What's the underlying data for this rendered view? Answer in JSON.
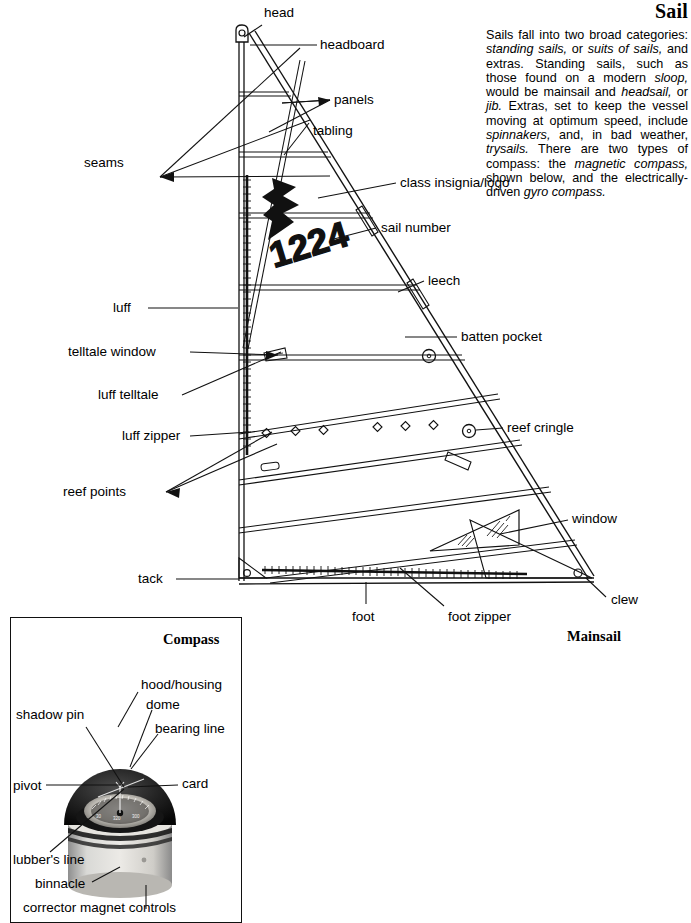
{
  "page": {
    "title": "Sail",
    "intro": "Sails fall into two broad categories: standing sails, or suits of sails, and extras. Standing sails, such as those found on a modern sloop, would be mainsail and headsail, or jib. Extras, set to keep the vessel moving at optimum speed, include spinnakers, and, in bad weather, trysails. There are two types of compass: the magnetic compass, shown below, and the electrically-driven gyro compass.",
    "mainsail_caption": "Mainsail"
  },
  "sail": {
    "sail_number": "1224",
    "labels": {
      "head": "head",
      "headboard": "headboard",
      "panels": "panels",
      "tabling": "tabling",
      "seams": "seams",
      "class_insignia": "class insignia/logo",
      "sail_number": "sail number",
      "leech": "leech",
      "luff": "luff",
      "batten_pocket": "batten pocket",
      "telltale_window": "telltale window",
      "luff_telltale": "luff telltale",
      "reef_cringle": "reef cringle",
      "luff_zipper": "luff zipper",
      "reef_points": "reef points",
      "window": "window",
      "tack": "tack",
      "foot": "foot",
      "foot_zipper": "foot zipper",
      "clew": "clew"
    }
  },
  "compass": {
    "title": "Compass",
    "labels": {
      "hood_housing": "hood/housing",
      "dome": "dome",
      "bearing_line": "bearing line",
      "shadow_pin": "shadow pin",
      "card": "card",
      "pivot": "pivot",
      "lubbers_line": "lubber's line",
      "binnacle": "binnacle",
      "corrector_magnet_controls": "corrector magnet controls"
    }
  },
  "colors": {
    "ink": "#111111",
    "paper": "#ffffff",
    "insignia": "#111111"
  }
}
